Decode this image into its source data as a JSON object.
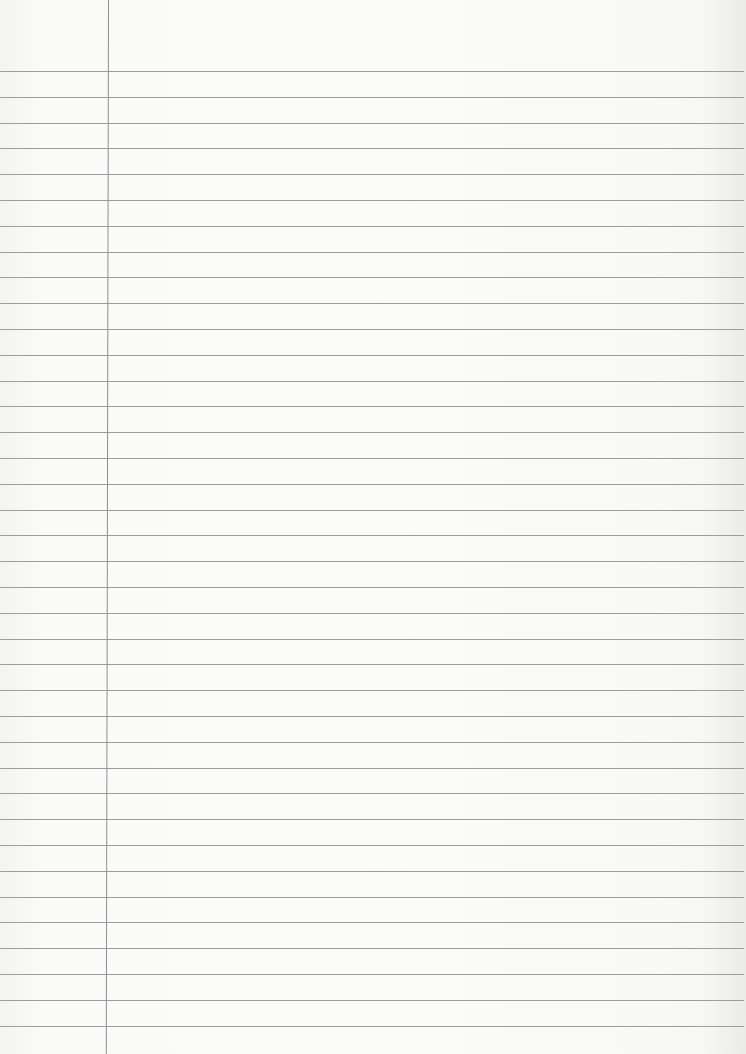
{
  "document": {
    "type": "lined-paper",
    "background_color": "#f7f7f6",
    "rule_color": "#9d9d9d",
    "margin_line_color": "#8f8f8f",
    "margin_x": 108,
    "first_rule_y": 71,
    "rule_spacing": 25.8,
    "rule_count": 38,
    "text": ""
  }
}
